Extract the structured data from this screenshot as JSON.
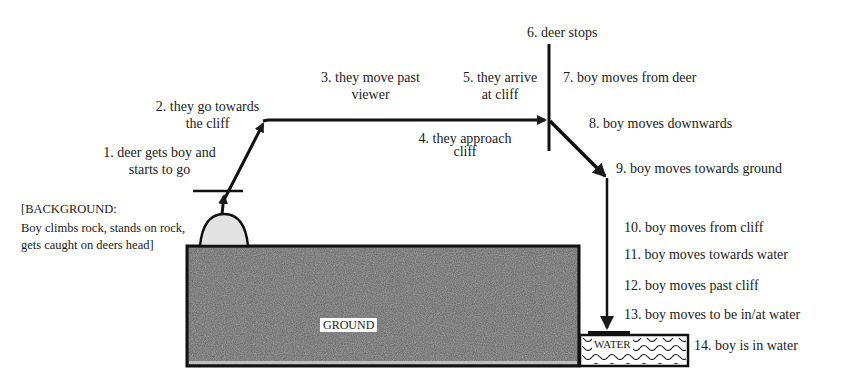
{
  "figure": {
    "background_note": {
      "line1": "[BACKGROUND:",
      "line2": "Boy climbs rock, stands on rock,",
      "line3": "gets caught on deers head]"
    },
    "regions": {
      "ground": "GROUND",
      "water": "WATER"
    },
    "steps": [
      {
        "n": 1,
        "line1": "1. deer gets boy and",
        "line2": "starts to go"
      },
      {
        "n": 2,
        "line1": "2. they go towards",
        "line2": "the cliff"
      },
      {
        "n": 3,
        "line1": "3. they move past",
        "line2": "viewer"
      },
      {
        "n": 4,
        "line1": "4. they approach",
        "line2": "cliff"
      },
      {
        "n": 5,
        "line1": "5. they arrive",
        "line2": "at cliff"
      },
      {
        "n": 6,
        "line1": "6. deer stops"
      },
      {
        "n": 7,
        "line1": "7. boy moves from deer"
      },
      {
        "n": 8,
        "line1": "8. boy moves downwards"
      },
      {
        "n": 9,
        "line1": "9. boy moves towards ground"
      },
      {
        "n": 10,
        "line1": "10. boy moves from cliff"
      },
      {
        "n": 11,
        "line1": "11. boy moves towards water"
      },
      {
        "n": 12,
        "line1": "12. boy moves past cliff"
      },
      {
        "n": 13,
        "line1": "13. boy moves to be in/at water"
      },
      {
        "n": 14,
        "line1": "14. boy is in water"
      }
    ],
    "colors": {
      "ink": "#1a1a1a",
      "ground_fill": "#6e6e6e",
      "rock_fill": "#e2e2e2",
      "water_fill": "#ffffff"
    }
  }
}
